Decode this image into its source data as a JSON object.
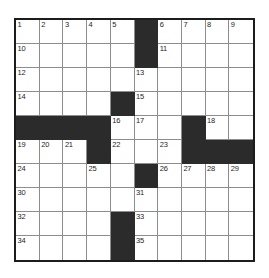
{
  "puzzle": {
    "type": "crossword-grid",
    "rows": 10,
    "columns": 10,
    "colors": {
      "background": "#ffffff",
      "block": "#2b2b2b",
      "grid_line": "#8d8d8d",
      "outer_border": "#1c1c1c",
      "number_text": "#262626"
    },
    "cells": [
      [
        {
          "block": false,
          "number": "1"
        },
        {
          "block": false,
          "number": "2"
        },
        {
          "block": false,
          "number": "3"
        },
        {
          "block": false,
          "number": "4"
        },
        {
          "block": false,
          "number": "5"
        },
        {
          "block": true,
          "number": ""
        },
        {
          "block": false,
          "number": "6"
        },
        {
          "block": false,
          "number": "7"
        },
        {
          "block": false,
          "number": "8"
        },
        {
          "block": false,
          "number": "9"
        }
      ],
      [
        {
          "block": false,
          "number": "10"
        },
        {
          "block": false,
          "number": ""
        },
        {
          "block": false,
          "number": ""
        },
        {
          "block": false,
          "number": ""
        },
        {
          "block": false,
          "number": ""
        },
        {
          "block": true,
          "number": ""
        },
        {
          "block": false,
          "number": "11"
        },
        {
          "block": false,
          "number": ""
        },
        {
          "block": false,
          "number": ""
        },
        {
          "block": false,
          "number": ""
        }
      ],
      [
        {
          "block": false,
          "number": "12"
        },
        {
          "block": false,
          "number": ""
        },
        {
          "block": false,
          "number": ""
        },
        {
          "block": false,
          "number": ""
        },
        {
          "block": false,
          "number": ""
        },
        {
          "block": false,
          "number": "13"
        },
        {
          "block": false,
          "number": ""
        },
        {
          "block": false,
          "number": ""
        },
        {
          "block": false,
          "number": ""
        },
        {
          "block": false,
          "number": ""
        }
      ],
      [
        {
          "block": false,
          "number": "14"
        },
        {
          "block": false,
          "number": ""
        },
        {
          "block": false,
          "number": ""
        },
        {
          "block": false,
          "number": ""
        },
        {
          "block": true,
          "number": ""
        },
        {
          "block": false,
          "number": "15"
        },
        {
          "block": false,
          "number": ""
        },
        {
          "block": false,
          "number": ""
        },
        {
          "block": false,
          "number": ""
        },
        {
          "block": false,
          "number": ""
        }
      ],
      [
        {
          "block": true,
          "number": ""
        },
        {
          "block": true,
          "number": ""
        },
        {
          "block": true,
          "number": ""
        },
        {
          "block": true,
          "number": ""
        },
        {
          "block": false,
          "number": "16"
        },
        {
          "block": false,
          "number": "17"
        },
        {
          "block": false,
          "number": ""
        },
        {
          "block": true,
          "number": ""
        },
        {
          "block": false,
          "number": "18"
        },
        {
          "block": false,
          "number": ""
        }
      ],
      [
        {
          "block": false,
          "number": "19"
        },
        {
          "block": false,
          "number": "20"
        },
        {
          "block": false,
          "number": "21"
        },
        {
          "block": true,
          "number": ""
        },
        {
          "block": false,
          "number": "22"
        },
        {
          "block": false,
          "number": ""
        },
        {
          "block": false,
          "number": "23"
        },
        {
          "block": true,
          "number": ""
        },
        {
          "block": true,
          "number": ""
        },
        {
          "block": true,
          "number": ""
        }
      ],
      [
        {
          "block": false,
          "number": "24"
        },
        {
          "block": false,
          "number": ""
        },
        {
          "block": false,
          "number": ""
        },
        {
          "block": false,
          "number": "25"
        },
        {
          "block": false,
          "number": ""
        },
        {
          "block": true,
          "number": ""
        },
        {
          "block": false,
          "number": "26"
        },
        {
          "block": false,
          "number": "27"
        },
        {
          "block": false,
          "number": "28"
        },
        {
          "block": false,
          "number": "29"
        }
      ],
      [
        {
          "block": false,
          "number": "30"
        },
        {
          "block": false,
          "number": ""
        },
        {
          "block": false,
          "number": ""
        },
        {
          "block": false,
          "number": ""
        },
        {
          "block": false,
          "number": ""
        },
        {
          "block": false,
          "number": "31"
        },
        {
          "block": false,
          "number": ""
        },
        {
          "block": false,
          "number": ""
        },
        {
          "block": false,
          "number": ""
        },
        {
          "block": false,
          "number": ""
        }
      ],
      [
        {
          "block": false,
          "number": "32"
        },
        {
          "block": false,
          "number": ""
        },
        {
          "block": false,
          "number": ""
        },
        {
          "block": false,
          "number": ""
        },
        {
          "block": true,
          "number": ""
        },
        {
          "block": false,
          "number": "33"
        },
        {
          "block": false,
          "number": ""
        },
        {
          "block": false,
          "number": ""
        },
        {
          "block": false,
          "number": ""
        },
        {
          "block": false,
          "number": ""
        }
      ],
      [
        {
          "block": false,
          "number": "34"
        },
        {
          "block": false,
          "number": ""
        },
        {
          "block": false,
          "number": ""
        },
        {
          "block": false,
          "number": ""
        },
        {
          "block": true,
          "number": ""
        },
        {
          "block": false,
          "number": "35"
        },
        {
          "block": false,
          "number": ""
        },
        {
          "block": false,
          "number": ""
        },
        {
          "block": false,
          "number": ""
        },
        {
          "block": false,
          "number": ""
        }
      ]
    ]
  }
}
